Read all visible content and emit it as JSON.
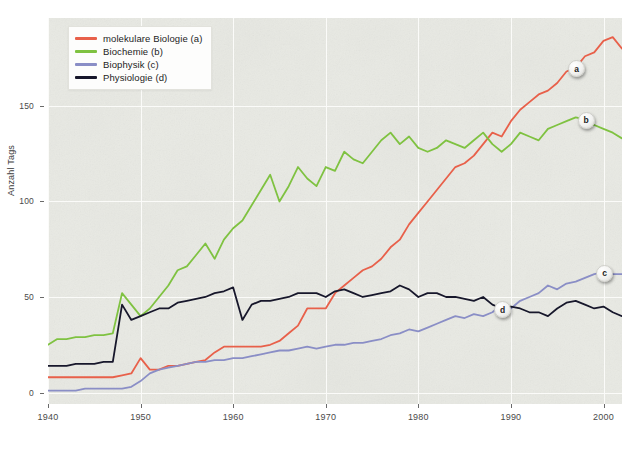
{
  "chart_data": {
    "type": "line",
    "title": "",
    "xlabel": "",
    "ylabel": "Anzahl Tags",
    "xlim": [
      1940,
      2002
    ],
    "ylim": [
      -6,
      196
    ],
    "xticks": [
      1940,
      1950,
      1960,
      1970,
      1980,
      1990,
      2000
    ],
    "yticks": [
      0,
      50,
      100,
      150
    ],
    "grid": true,
    "legend_position": "top-left",
    "colors": {
      "molekulare_biologie": "#e8604a",
      "biochemie": "#7fc241",
      "biophysik": "#8a8ec6",
      "physiologie": "#17172b",
      "plot_background": "#e9eae4",
      "gridline": "#fbfbf9",
      "axis_text": "#4a4a4a"
    },
    "x": [
      1940,
      1941,
      1942,
      1943,
      1944,
      1945,
      1946,
      1947,
      1948,
      1949,
      1950,
      1951,
      1952,
      1953,
      1954,
      1955,
      1956,
      1957,
      1958,
      1959,
      1960,
      1961,
      1962,
      1963,
      1964,
      1965,
      1966,
      1967,
      1968,
      1969,
      1970,
      1971,
      1972,
      1973,
      1974,
      1975,
      1976,
      1977,
      1978,
      1979,
      1980,
      1981,
      1982,
      1983,
      1984,
      1985,
      1986,
      1987,
      1988,
      1989,
      1990,
      1991,
      1992,
      1993,
      1994,
      1995,
      1996,
      1997,
      1998,
      1999,
      2000,
      2001,
      2002
    ],
    "series": [
      {
        "name": "molekulare Biologie (a)",
        "key": "a",
        "color": "#e8604a",
        "endpoint_label": "a",
        "values": [
          8,
          8,
          8,
          8,
          8,
          8,
          8,
          8,
          9,
          10,
          18,
          12,
          12,
          14,
          14,
          15,
          16,
          17,
          21,
          24,
          24,
          24,
          24,
          24,
          25,
          27,
          31,
          35,
          44,
          44,
          44,
          52,
          56,
          60,
          64,
          66,
          70,
          76,
          80,
          88,
          94,
          100,
          106,
          112,
          118,
          120,
          124,
          130,
          136,
          134,
          142,
          148,
          152,
          156,
          158,
          162,
          168,
          170,
          176,
          178,
          184,
          186,
          180
        ]
      },
      {
        "name": "Biochemie (b)",
        "key": "b",
        "color": "#7fc241",
        "endpoint_label": "b",
        "values": [
          25,
          28,
          28,
          29,
          29,
          30,
          30,
          31,
          52,
          46,
          40,
          44,
          50,
          56,
          64,
          66,
          72,
          78,
          70,
          80,
          86,
          90,
          98,
          106,
          114,
          100,
          108,
          118,
          112,
          108,
          118,
          116,
          126,
          122,
          120,
          126,
          132,
          136,
          130,
          134,
          128,
          126,
          128,
          132,
          130,
          128,
          132,
          136,
          130,
          126,
          130,
          136,
          134,
          132,
          138,
          140,
          142,
          144,
          143,
          140,
          138,
          136,
          133
        ]
      },
      {
        "name": "Biophysik (c)",
        "key": "c",
        "color": "#8a8ec6",
        "endpoint_label": "c",
        "values": [
          1,
          1,
          1,
          1,
          2,
          2,
          2,
          2,
          2,
          3,
          6,
          10,
          12,
          13,
          14,
          15,
          16,
          16,
          17,
          17,
          18,
          18,
          19,
          20,
          21,
          22,
          22,
          23,
          24,
          23,
          24,
          25,
          25,
          26,
          26,
          27,
          28,
          30,
          31,
          33,
          32,
          34,
          36,
          38,
          40,
          39,
          41,
          40,
          42,
          46,
          44,
          48,
          50,
          52,
          56,
          54,
          57,
          58,
          60,
          62,
          63,
          62,
          62
        ]
      },
      {
        "name": "Physiologie (d)",
        "key": "d",
        "color": "#17172b",
        "endpoint_label": "d",
        "values": [
          14,
          14,
          14,
          15,
          15,
          15,
          16,
          16,
          46,
          38,
          40,
          42,
          44,
          44,
          47,
          48,
          49,
          50,
          52,
          53,
          55,
          38,
          46,
          48,
          48,
          49,
          50,
          52,
          52,
          52,
          50,
          53,
          54,
          52,
          50,
          51,
          52,
          53,
          56,
          54,
          50,
          52,
          52,
          50,
          50,
          49,
          48,
          50,
          46,
          44,
          45,
          44,
          42,
          42,
          40,
          44,
          47,
          48,
          46,
          44,
          45,
          42,
          40
        ]
      }
    ]
  },
  "legend": {
    "items": [
      {
        "label": "molekulare Biologie (a)",
        "color": "#e8604a"
      },
      {
        "label": "Biochemie (b)",
        "color": "#7fc241"
      },
      {
        "label": "Biophysik (c)",
        "color": "#8a8ec6"
      },
      {
        "label": "Physiologie (d)",
        "color": "#17172b"
      }
    ]
  },
  "axes": {
    "y_label": "Anzahl Tags",
    "y_tick_labels": [
      "0",
      "50",
      "100",
      "150"
    ],
    "x_tick_labels": [
      "1940",
      "1950",
      "1960",
      "1970",
      "1980",
      "1990",
      "2000"
    ]
  }
}
